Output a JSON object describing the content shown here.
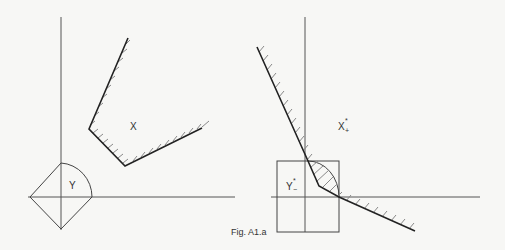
{
  "figure": {
    "caption": "Fig. A1.a",
    "left_panel": {
      "region_x_label": "X",
      "region_y_label": "Y"
    },
    "right_panel": {
      "region_x_label": "X",
      "region_x_superscript": "*",
      "region_x_subscript": "+",
      "region_y_label": "Y",
      "region_y_superscript": "*",
      "region_y_subscript": "−"
    }
  }
}
